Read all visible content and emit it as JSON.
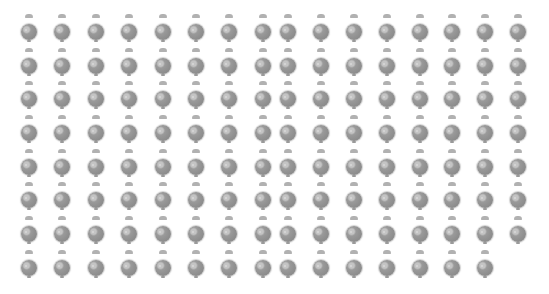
{
  "canvas": {
    "width": 549,
    "height": 294,
    "background": "#ffffff"
  },
  "sprite": {
    "icon": "gray-ball-with-cap-icon",
    "color": "#8c8c8c",
    "cap_color": "#a8a8a8"
  },
  "grid": {
    "columns_x": [
      29,
      62,
      96,
      129,
      163,
      196,
      229,
      263,
      288,
      321,
      354,
      387,
      420,
      452,
      485,
      518
    ],
    "rows_y": [
      16,
      50,
      83,
      117,
      151,
      184,
      218,
      252
    ],
    "row_counts": [
      16,
      16,
      16,
      16,
      16,
      16,
      16,
      15
    ],
    "total": 127
  }
}
